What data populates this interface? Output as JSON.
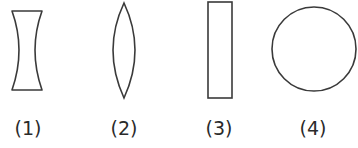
{
  "figure": {
    "stroke_color": "#3a3a3a",
    "background": "#ffffff",
    "shapes": [
      {
        "id": 1,
        "label": "(1)",
        "type": "concave-lens"
      },
      {
        "id": 2,
        "label": "(2)",
        "type": "convex-lens"
      },
      {
        "id": 3,
        "label": "(3)",
        "type": "rectangular-block"
      },
      {
        "id": 4,
        "label": "(4)",
        "type": "circle"
      }
    ]
  }
}
